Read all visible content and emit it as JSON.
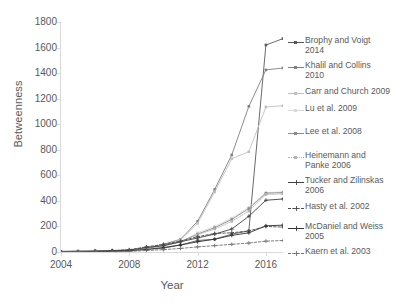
{
  "chart_data": {
    "type": "line",
    "title": "",
    "xlabel": "Year",
    "ylabel": "Betweenness",
    "xlim": [
      2004,
      2017
    ],
    "ylim": [
      0,
      1800
    ],
    "ytick_step": 200,
    "yticks": [
      "1800",
      "1600",
      "1400",
      "1200",
      "1000",
      "800",
      "600",
      "400",
      "200",
      "0"
    ],
    "xticks": [
      "2004",
      "2008",
      "2012",
      "2016"
    ],
    "x": [
      2004,
      2005,
      2006,
      2007,
      2008,
      2009,
      2010,
      2011,
      2012,
      2013,
      2014,
      2015,
      2016,
      2017
    ],
    "grid": false,
    "legend_position": "right",
    "series": [
      {
        "name": "Brophy and Voigt 2014",
        "label": "Brophy and Voigt\n2014",
        "color": "#595959",
        "dash": "solid",
        "marker": "square",
        "values": [
          5,
          8,
          10,
          12,
          14,
          20,
          30,
          55,
          90,
          100,
          140,
          165,
          1620,
          1670
        ]
      },
      {
        "name": "Khalil and Collins 2010",
        "label": "Khalil and Collins\n2010",
        "color": "#808080",
        "dash": "solid",
        "marker": "square",
        "values": [
          0,
          0,
          0,
          0,
          5,
          30,
          60,
          100,
          240,
          490,
          760,
          1140,
          1425,
          1440
        ]
      },
      {
        "name": "Carr and Church 2009",
        "label": "Carr and Church 2009",
        "color": "#bfbfbf",
        "dash": "solid",
        "marker": "square",
        "values": [
          0,
          0,
          0,
          0,
          5,
          25,
          55,
          95,
          225,
          470,
          730,
          785,
          1135,
          1145
        ]
      },
      {
        "name": "Lu et al. 2009",
        "label": "Lu et al. 2009",
        "color": "#d9d9d9",
        "dash": "solid",
        "marker": "square",
        "values": [
          0,
          0,
          0,
          0,
          5,
          20,
          45,
          75,
          150,
          200,
          265,
          350,
          465,
          470
        ]
      },
      {
        "name": "Lee et al. 2008",
        "label": "Lee et al. 2008",
        "color": "#8c8c8c",
        "dash": "solid",
        "marker": "square",
        "values": [
          0,
          0,
          0,
          5,
          10,
          30,
          50,
          80,
          140,
          190,
          255,
          340,
          460,
          465
        ]
      },
      {
        "name": "Heinemann and Panke 2006",
        "label": "Heinemann and\nPanke 2006",
        "color": "#b3b3b3",
        "dash": "dotted",
        "marker": "square",
        "values": [
          0,
          0,
          5,
          8,
          12,
          35,
          55,
          85,
          135,
          180,
          240,
          320,
          450,
          455
        ]
      },
      {
        "name": "Tucker and Zilinskas 2006",
        "label": "Tucker and Zilinskas\n2006",
        "color": "#404040",
        "dash": "solid",
        "marker": "plus",
        "values": [
          0,
          0,
          5,
          10,
          15,
          35,
          50,
          80,
          110,
          140,
          180,
          280,
          405,
          415
        ]
      },
      {
        "name": "Hasty et al. 2002",
        "label": "Hasty et al. 2002",
        "color": "#4d4d4d",
        "dash": "dashed",
        "marker": "plus",
        "values": [
          0,
          0,
          5,
          10,
          18,
          40,
          60,
          85,
          120,
          145,
          150,
          165,
          200,
          195
        ]
      },
      {
        "name": "McDaniel and Weiss 2005",
        "label": "McDaniel and Weiss\n2005",
        "color": "#333333",
        "dash": "solid",
        "marker": "plus",
        "values": [
          0,
          0,
          0,
          5,
          10,
          20,
          35,
          55,
          80,
          100,
          130,
          150,
          205,
          210
        ]
      },
      {
        "name": "Kaern et al. 2003",
        "label": "Kaern et al. 2003",
        "color": "#737373",
        "dash": "dashed",
        "marker": "plus",
        "values": [
          0,
          0,
          0,
          0,
          5,
          12,
          18,
          28,
          40,
          50,
          60,
          70,
          85,
          90
        ]
      }
    ]
  }
}
